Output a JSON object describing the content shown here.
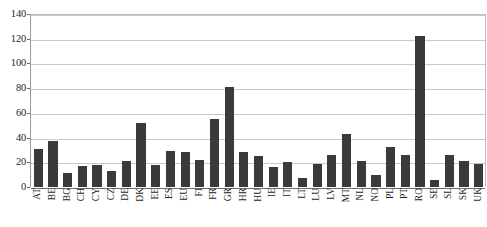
{
  "chart_data": {
    "type": "bar",
    "title": "",
    "xlabel": "",
    "ylabel": "",
    "ylim": [
      0,
      140
    ],
    "yticks": [
      0,
      20,
      40,
      60,
      80,
      100,
      120,
      140
    ],
    "ytick_labels": [
      "0",
      "20",
      "40",
      "60",
      "80",
      "100",
      "120",
      "140"
    ],
    "grid": true,
    "legend": "none",
    "bar_color": "#3a3a3a",
    "categories": [
      "AT",
      "BE",
      "BG",
      "CH",
      "CY",
      "CZ",
      "DE",
      "DK",
      "EE",
      "ES",
      "EU",
      "FI",
      "FR",
      "GR",
      "HR",
      "HU",
      "IE",
      "IT",
      "LT",
      "LU",
      "LV",
      "MT",
      "NL",
      "NO",
      "PL",
      "PT",
      "RO",
      "SE",
      "SL",
      "SK",
      "UK"
    ],
    "values": [
      31,
      37,
      11,
      17,
      18,
      13,
      21,
      52,
      18,
      29,
      28,
      22,
      55,
      81,
      28,
      25,
      16,
      20,
      7,
      19,
      26,
      43,
      21,
      10,
      32,
      26,
      122,
      6,
      26,
      21,
      19
    ]
  }
}
